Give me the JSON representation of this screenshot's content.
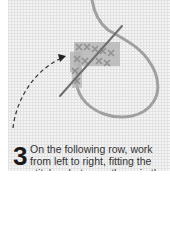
{
  "step": {
    "number": "3",
    "lines": [
      "On the following row, work",
      "from left to right, fitting the",
      "stitches between those in the"
    ]
  },
  "illustration": {
    "subject": "cross-stitch-on-canvas",
    "thread_color": "#9a9a9a",
    "stitch_color": "#a8a8a8",
    "arrow": "dashed-curved-arrow"
  }
}
